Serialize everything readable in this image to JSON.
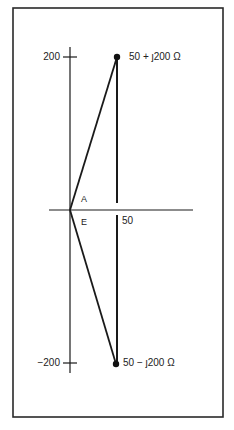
{
  "diagram": {
    "type": "complex-impedance-plane",
    "colors": {
      "line": "#1a1a1a",
      "frame": "#2a2a2a",
      "text": "#222222",
      "background": "#ffffff"
    },
    "axes": {
      "imaginary_ticks": [
        {
          "label": "200",
          "value": 200
        },
        {
          "label": "−200",
          "value": -200
        }
      ],
      "real_ticks": [
        {
          "label": "50",
          "value": 50
        }
      ]
    },
    "points": [
      {
        "label": "50 + ȷ200 Ω",
        "real": 50,
        "imag": 200
      },
      {
        "label": "50 − ȷ200 Ω",
        "real": 50,
        "imag": -200
      }
    ],
    "angle_labels": {
      "upper": "A",
      "lower": "E"
    }
  }
}
